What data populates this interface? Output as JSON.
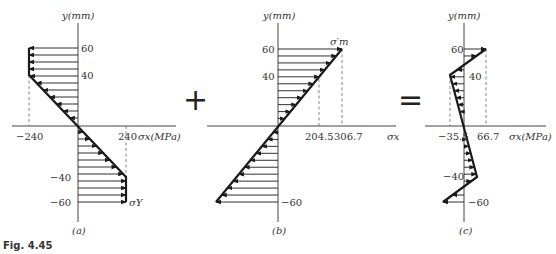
{
  "figure": {
    "caption": "Fig. 4.45",
    "operators": {
      "plus": "+",
      "equals": "="
    }
  },
  "panels": [
    {
      "id": "a",
      "label": "(a)",
      "y_axis_label": "y(mm)",
      "x_axis_label": "σx(MPa)",
      "y_ticks": [
        "60",
        "40",
        "−40",
        "−60"
      ],
      "x_ticks": [
        "−240",
        "240"
      ],
      "annotation": "σY",
      "description": "Elastoplastic stress distribution: yield stress ±240 MPa at |y| ≥ 40 mm, linear between",
      "profile": [
        [
          -240,
          60
        ],
        [
          -240,
          40
        ],
        [
          240,
          -40
        ],
        [
          240,
          -60
        ]
      ]
    },
    {
      "id": "b",
      "label": "(b)",
      "y_axis_label": "y(mm)",
      "x_axis_label": "σx",
      "y_ticks": [
        "60",
        "40",
        "−60"
      ],
      "x_ticks": [
        "204.5",
        "306.7"
      ],
      "annotation": "σ′m",
      "description": "Elastic unloading stress distribution, linear from −306.7 to 306.7 MPa",
      "profile": [
        [
          306.7,
          60
        ],
        [
          -306.7,
          -60
        ]
      ]
    },
    {
      "id": "c",
      "label": "(c)",
      "y_axis_label": "y(mm)",
      "x_axis_label": "σx(MPa)",
      "y_ticks": [
        "60",
        "40",
        "−40",
        "−60"
      ],
      "x_ticks": [
        "−35.5",
        "66.7"
      ],
      "description": "Residual stress distribution",
      "profile": [
        [
          66.7,
          60
        ],
        [
          -35.5,
          40
        ],
        [
          35.5,
          -40
        ],
        [
          -66.7,
          -60
        ]
      ]
    }
  ]
}
